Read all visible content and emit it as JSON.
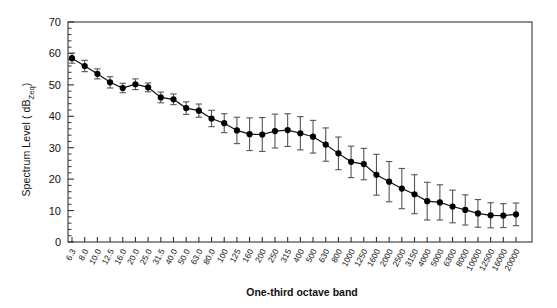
{
  "chart_data": {
    "type": "line",
    "title": "",
    "xlabel": "One-third octave band",
    "ylabel": "Spectrum Level ( dBZeq)",
    "ylabel_main": "Spectrum Level ( dB",
    "ylabel_sub": "Zeq",
    "ylabel_tail": ")",
    "ylim": [
      0,
      70
    ],
    "ytick_step": 10,
    "yticks": [
      "0",
      "10",
      "20",
      "30",
      "40",
      "50",
      "60",
      "70"
    ],
    "minor_ticks_per_interval": 5,
    "grid": false,
    "legend": null,
    "marker": "filled-circle",
    "error_bars": true,
    "categories": [
      "6.3",
      "8.0",
      "10.0",
      "12.5",
      "16.0",
      "20.0",
      "25.0",
      "31.5",
      "40.0",
      "50.0",
      "63.0",
      "80.0",
      "100",
      "125",
      "160",
      "200",
      "250",
      "315",
      "400",
      "500",
      "630",
      "800",
      "1000",
      "1250",
      "1600",
      "2000",
      "2500",
      "3150",
      "4000",
      "5000",
      "6300",
      "8000",
      "10000",
      "12500",
      "16000",
      "20000"
    ],
    "values": [
      58.5,
      56.0,
      53.5,
      50.8,
      49.0,
      50.2,
      49.2,
      46.0,
      45.4,
      42.6,
      41.8,
      39.3,
      37.8,
      35.5,
      34.3,
      34.2,
      35.3,
      35.6,
      34.6,
      33.5,
      31.0,
      28.2,
      25.5,
      24.8,
      21.4,
      19.2,
      17.0,
      15.2,
      13.0,
      12.6,
      11.3,
      10.2,
      9.1,
      8.5,
      8.4,
      8.8
    ],
    "err_upper": [
      1.6,
      1.8,
      1.6,
      1.8,
      1.5,
      1.7,
      1.4,
      1.7,
      1.7,
      2.0,
      2.1,
      2.6,
      3.0,
      4.2,
      5.2,
      5.4,
      5.4,
      5.2,
      5.3,
      5.2,
      5.3,
      5.2,
      5.0,
      5.0,
      6.5,
      6.4,
      6.4,
      6.2,
      6.0,
      5.6,
      5.2,
      4.8,
      4.4,
      4.0,
      3.8,
      3.6
    ],
    "err_lower": [
      1.6,
      1.8,
      1.6,
      1.8,
      1.5,
      1.7,
      1.4,
      1.7,
      1.7,
      2.0,
      2.1,
      2.6,
      3.0,
      4.2,
      5.2,
      5.4,
      5.4,
      5.2,
      5.3,
      5.2,
      5.3,
      5.2,
      5.0,
      5.0,
      6.5,
      6.4,
      6.4,
      6.2,
      6.0,
      5.6,
      5.2,
      4.8,
      4.4,
      4.0,
      3.8,
      3.6
    ]
  },
  "colors": {
    "line": "#111111",
    "marker": "#000000",
    "error_bar": "#555555",
    "axis": "#333333",
    "text": "#111111",
    "background": "#ffffff"
  }
}
